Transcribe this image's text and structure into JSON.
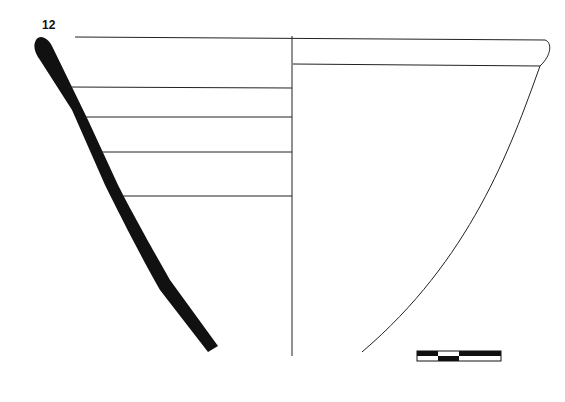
{
  "figure": {
    "number_label": "12",
    "scale_bar": {
      "segments": 4
    }
  }
}
